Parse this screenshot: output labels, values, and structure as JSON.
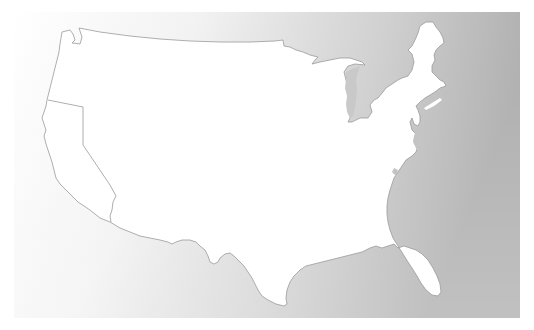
{
  "map": {
    "title": "Contiguous United States outline map",
    "background": {
      "gradient_start": "#ffffff",
      "gradient_mid": "#e6e6e6",
      "gradient_end": "#aaaaaa",
      "panel": {
        "x": 14,
        "y": 12,
        "width": 506,
        "height": 306
      }
    },
    "land_color": "#ffffff",
    "border_color": "#9a9a9a",
    "regions": [
      {
        "name": "contiguous-us",
        "label": "United States (contiguous)"
      },
      {
        "name": "california",
        "label": "California"
      }
    ],
    "water_bodies": [
      {
        "name": "lake-michigan",
        "label": "Lake Michigan"
      },
      {
        "name": "chesapeake-bay",
        "label": "Chesapeake Bay"
      }
    ]
  }
}
